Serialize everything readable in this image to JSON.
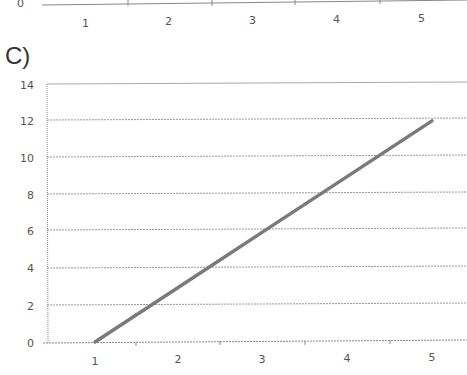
{
  "top_fragment": {
    "y_label": "0",
    "x_ticks": [
      "1",
      "2",
      "3",
      "4",
      "5"
    ]
  },
  "panel": {
    "label": "C)"
  },
  "chart_data": {
    "type": "line",
    "title": "",
    "xlabel": "",
    "ylabel": "",
    "categories": [
      "1",
      "2",
      "3",
      "4",
      "5"
    ],
    "series": [
      {
        "name": "Series 1",
        "x": [
          1,
          2,
          3,
          4,
          5
        ],
        "values": [
          0,
          3,
          6,
          9,
          12
        ]
      }
    ],
    "y_ticks": [
      "0",
      "2",
      "4",
      "6",
      "8",
      "10",
      "12",
      "14"
    ],
    "ylim": [
      0,
      14
    ],
    "xlim": [
      1,
      5
    ],
    "grid": true,
    "legend": "none",
    "line_color": "#7a7a7a"
  }
}
